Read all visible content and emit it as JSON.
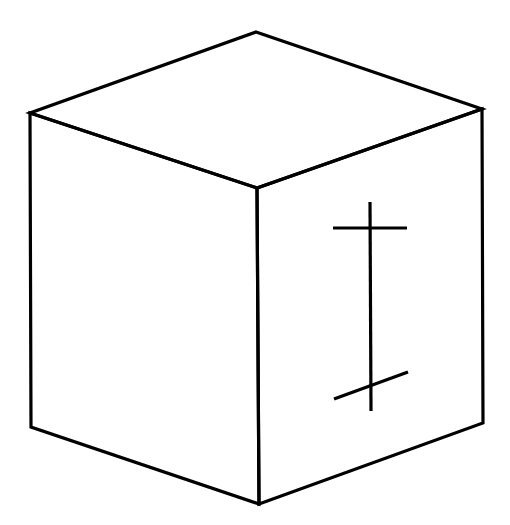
{
  "figure": {
    "stroke_color": "#000000",
    "background_color": "#ffffff",
    "vertices": {
      "top": [
        256,
        32
      ],
      "top_left": [
        30,
        113
      ],
      "top_right": [
        482,
        109
      ],
      "front_top": [
        257,
        188
      ],
      "bottom_left": [
        31,
        427
      ],
      "bottom_right": [
        483,
        423
      ],
      "front_bottom": [
        259,
        504
      ]
    },
    "right_face_mark": {
      "vertical_line": [
        [
          370,
          202
        ],
        [
          371,
          411
        ]
      ],
      "top_tick": [
        [
          333,
          228
        ],
        [
          407,
          228
        ]
      ],
      "bottom_tick": [
        [
          334,
          399
        ],
        [
          408,
          372
        ]
      ]
    }
  }
}
